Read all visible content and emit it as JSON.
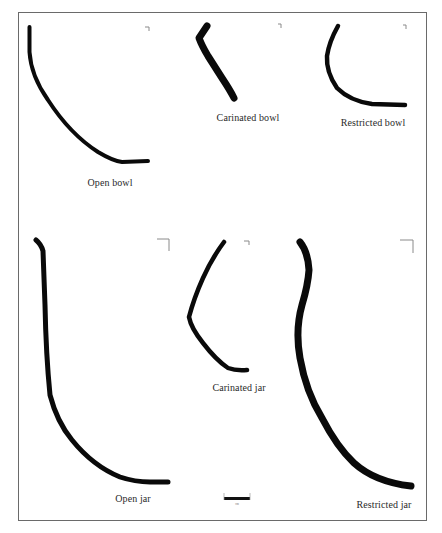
{
  "figure": {
    "title": "",
    "border_color": "#6a6a6a",
    "profile_color": "#0a0a0a",
    "vessels": [
      {
        "id": "open-bowl",
        "label": "Open bowl"
      },
      {
        "id": "carinated-bowl",
        "label": "Carinated bowl"
      },
      {
        "id": "restricted-bowl",
        "label": "Restricted bowl"
      },
      {
        "id": "open-jar",
        "label": "Open jar"
      },
      {
        "id": "carinated-jar",
        "label": "Carinated jar"
      },
      {
        "id": "restricted-jar",
        "label": "Restricted jar"
      }
    ],
    "scale_bar": {
      "label": "cm"
    }
  }
}
